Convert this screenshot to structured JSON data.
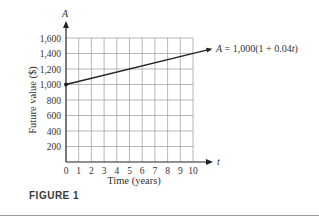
{
  "figure": {
    "caption": "FIGURE 1"
  },
  "chart_data": {
    "type": "line",
    "title": "",
    "xlabel": "Time (years)",
    "ylabel": "Future value ($)",
    "x_axis_var": "t",
    "y_axis_var": "A",
    "x_ticks": [
      0,
      1,
      2,
      3,
      4,
      5,
      6,
      7,
      8,
      9,
      10
    ],
    "y_ticks": [
      200,
      400,
      600,
      800,
      1000,
      1200,
      1400,
      1600
    ],
    "y_tick_labels": [
      "200",
      "400",
      "600",
      "800",
      "1,000",
      "1,200",
      "1,400",
      "1,600"
    ],
    "xlim": [
      0,
      10
    ],
    "ylim": [
      0,
      1600
    ],
    "grid": true,
    "series": [
      {
        "name": "A = 1,000(1 + 0.04t)",
        "x": [
          0,
          1,
          2,
          3,
          4,
          5,
          6,
          7,
          8,
          9,
          10
        ],
        "values": [
          1000,
          1040,
          1080,
          1120,
          1160,
          1200,
          1240,
          1280,
          1320,
          1360,
          1400
        ]
      }
    ],
    "annotations": [
      {
        "text_parts": [
          "A",
          " = 1,000(1 + 0.04",
          "t",
          ")"
        ],
        "points_to": [
          10,
          1400
        ]
      }
    ],
    "start_point": [
      0,
      1000
    ]
  }
}
